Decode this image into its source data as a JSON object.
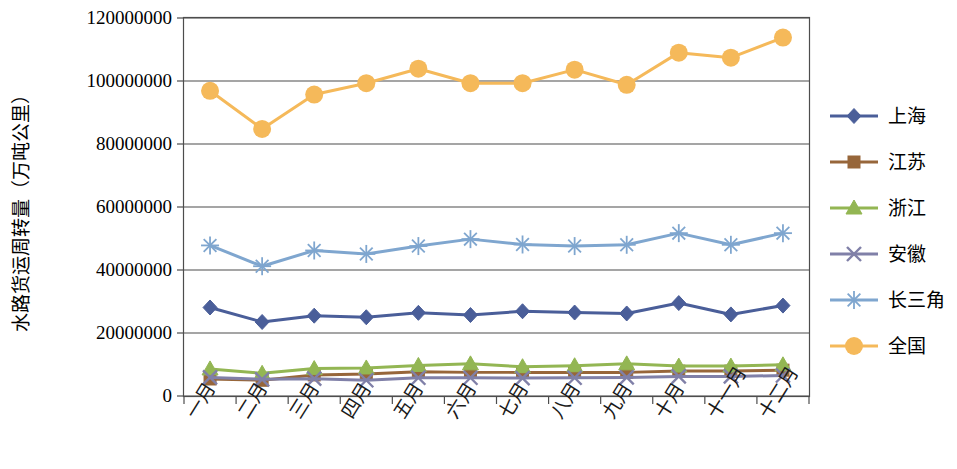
{
  "chart_data": {
    "type": "line",
    "title": "",
    "xlabel": "",
    "ylabel": "水路货运周转量（万吨公里）",
    "ylim": [
      0,
      120000000
    ],
    "yticks": [
      0,
      20000000,
      40000000,
      60000000,
      80000000,
      100000000,
      120000000
    ],
    "ytick_labels": [
      "0",
      "20000000",
      "40000000",
      "60000000",
      "80000000",
      "100000000",
      "120000000"
    ],
    "grid": true,
    "legend_position": "right",
    "categories": [
      "一月",
      "二月",
      "三月",
      "四月",
      "五月",
      "六月",
      "七月",
      "八月",
      "九月",
      "十月",
      "十一月",
      "十二月"
    ],
    "series": [
      {
        "name": "上海",
        "color": "#4A5E99",
        "marker": "diamond",
        "values": [
          28100000,
          23500000,
          25500000,
          25000000,
          26400000,
          25700000,
          26900000,
          26500000,
          26200000,
          29500000,
          25900000,
          28700000
        ]
      },
      {
        "name": "江苏",
        "color": "#97663A",
        "marker": "square",
        "values": [
          5400000,
          5000000,
          6700000,
          7000000,
          7700000,
          7500000,
          7500000,
          7500000,
          7500000,
          7900000,
          7900000,
          8200000
        ]
      },
      {
        "name": "浙江",
        "color": "#93B653",
        "marker": "triangle",
        "values": [
          8600000,
          7200000,
          8700000,
          8900000,
          9700000,
          10200000,
          9300000,
          9600000,
          10200000,
          9500000,
          9500000,
          9900000
        ]
      },
      {
        "name": "安徽",
        "color": "#8080A8",
        "marker": "cross",
        "values": [
          5900000,
          5300000,
          5500000,
          5000000,
          5800000,
          5800000,
          5700000,
          5800000,
          5900000,
          6200000,
          6200000,
          6500000
        ]
      },
      {
        "name": "长三角",
        "color": "#7FA6CF",
        "marker": "asterisk",
        "values": [
          47800000,
          41200000,
          46200000,
          45100000,
          47600000,
          49800000,
          48100000,
          47600000,
          48000000,
          51700000,
          48000000,
          51700000
        ]
      },
      {
        "name": "全国",
        "color": "#F5B95A",
        "marker": "circle",
        "values": [
          96900000,
          84800000,
          95700000,
          99300000,
          103900000,
          99300000,
          99300000,
          103600000,
          98800000,
          109000000,
          107400000,
          113800000
        ]
      }
    ]
  },
  "legend": {
    "items": [
      {
        "label": "上海"
      },
      {
        "label": "江苏"
      },
      {
        "label": "浙江"
      },
      {
        "label": "安徽"
      },
      {
        "label": "长三角"
      },
      {
        "label": "全国"
      }
    ]
  }
}
